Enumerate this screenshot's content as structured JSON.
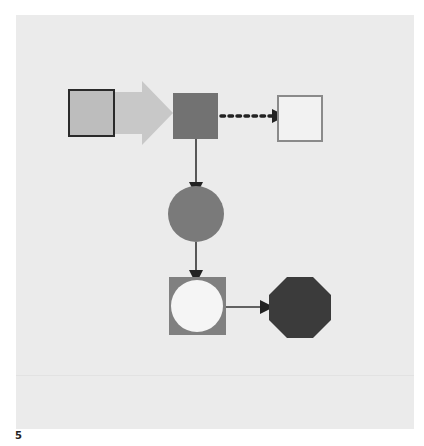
{
  "page": {
    "label": "5"
  },
  "colors": {
    "background": "#ffffff",
    "panel": "#ebebeb",
    "box_light_fill": "#bdbdbd",
    "box_border_dark": "#2a2a2a",
    "big_arrow": "#c8c8c8",
    "box_mid_fill": "#727272",
    "target_box_border": "#8a8a8a",
    "target_box_fill": "#f2f2f2",
    "circle_fill": "#7a7a7a",
    "connector": "#333333",
    "arrowhead": "#222222",
    "framed_circle_frame": "#808080",
    "framed_circle_inner": "#f5f5f5",
    "octagon_fill": "#3b3b3b"
  },
  "diagram": {
    "nodes": [
      {
        "id": "source-square",
        "shape": "square",
        "style": "light gray fill, dark outline"
      },
      {
        "id": "process-square",
        "shape": "square",
        "style": "medium gray filled"
      },
      {
        "id": "target-square",
        "shape": "square",
        "style": "white fill, gray outline"
      },
      {
        "id": "process-circle",
        "shape": "circle",
        "style": "medium gray filled"
      },
      {
        "id": "framed-circle",
        "shape": "square with inscribed circle",
        "style": "gray frame, white circle"
      },
      {
        "id": "end-octagon",
        "shape": "octagon",
        "style": "dark gray filled"
      }
    ],
    "edges": [
      {
        "from": "source-square",
        "to": "process-square",
        "style": "thick block arrow, light gray"
      },
      {
        "from": "process-square",
        "to": "target-square",
        "style": "dotted arrow"
      },
      {
        "from": "process-square",
        "to": "process-circle",
        "style": "solid arrow"
      },
      {
        "from": "process-circle",
        "to": "framed-circle",
        "style": "solid arrow"
      },
      {
        "from": "framed-circle",
        "to": "end-octagon",
        "style": "solid arrow"
      }
    ]
  }
}
